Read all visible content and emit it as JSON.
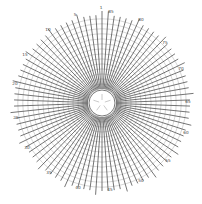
{
  "diagram": {
    "type": "polar-radial-grid",
    "center": [
      102,
      103
    ],
    "spoke_count": 90,
    "spoke_step_deg": 4,
    "inner_radius": 14,
    "outer_radius": 92,
    "ring_count": 14,
    "colors": {
      "spoke": "#3a3a3a",
      "ring": "#8a8a8a",
      "background": "#ffffff"
    },
    "labels": [
      {
        "text": "1",
        "x": 101,
        "y": 8
      },
      {
        "text": "5",
        "x": 75,
        "y": 15
      },
      {
        "text": "10",
        "x": 48,
        "y": 30
      },
      {
        "text": "15",
        "x": 25,
        "y": 55
      },
      {
        "text": "20",
        "x": 15,
        "y": 84
      },
      {
        "text": "25",
        "x": 16,
        "y": 118
      },
      {
        "text": "30",
        "x": 27,
        "y": 148
      },
      {
        "text": "35",
        "x": 49,
        "y": 173
      },
      {
        "text": "40",
        "x": 78,
        "y": 188
      },
      {
        "text": "45",
        "x": 110,
        "y": 190
      },
      {
        "text": "50",
        "x": 141,
        "y": 181
      },
      {
        "text": "55",
        "x": 168,
        "y": 161
      },
      {
        "text": "60",
        "x": 186,
        "y": 133
      },
      {
        "text": "65",
        "x": 188,
        "y": 102
      },
      {
        "text": "70",
        "x": 181,
        "y": 69
      },
      {
        "text": "75",
        "x": 165,
        "y": 43
      },
      {
        "text": "80",
        "x": 141,
        "y": 20
      },
      {
        "text": "85",
        "x": 111,
        "y": 12
      }
    ]
  }
}
